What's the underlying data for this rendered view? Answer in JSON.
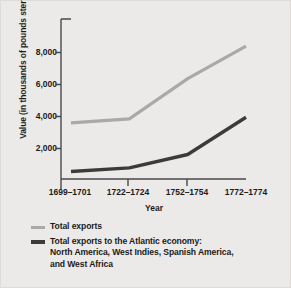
{
  "chart_data": {
    "type": "line",
    "title": "",
    "xlabel": "Year",
    "ylabel": "Value (in thousands of pounds sterling)",
    "categories": [
      "1699–1701",
      "1722–1724",
      "1752–1754",
      "1772–1774"
    ],
    "yticks": [
      "2,000",
      "4,000",
      "6,000",
      "8,000"
    ],
    "ytick_values": [
      2000,
      4000,
      6000,
      8000
    ],
    "ylim": [
      0,
      9200
    ],
    "grid": false,
    "legend_position": "below",
    "series": [
      {
        "name": "Total exports",
        "color": "#a9a9a9",
        "values": [
          3550,
          3800,
          6350,
          8400
        ]
      },
      {
        "name": "Total exports to the Atlantic economy: North America, West Indies, Spanish America, and West Africa",
        "color": "#3b3b3b",
        "values": [
          475,
          700,
          1550,
          3900
        ]
      }
    ]
  },
  "axes": {
    "y_title": "Value (in thousands of pounds sterling)",
    "x_title": "Year",
    "y_tick_labels": [
      "8,000",
      "6,000",
      "4,000",
      "2,000"
    ],
    "x_tick_labels": [
      "1699–1701",
      "1722–1724",
      "1752–1754",
      "1772–1774"
    ]
  },
  "legend": {
    "items": [
      {
        "label": "Total exports",
        "color": "#a9a9a9"
      },
      {
        "label_line1": "Total exports to the Atlantic economy:",
        "label_line2": "North America, West Indies, Spanish America,",
        "label_line3": "and West Africa",
        "color": "#3b3b3b"
      }
    ]
  },
  "colors": {
    "background": "#eceae8",
    "axis": "#4a4a4a",
    "text": "#1b1b1b",
    "series_total_exports": "#a9a9a9",
    "series_atlantic": "#3b3b3b"
  }
}
